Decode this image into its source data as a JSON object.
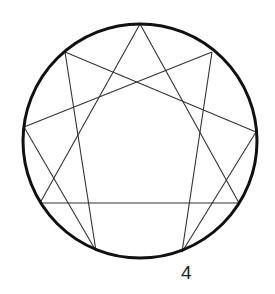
{
  "diagram": {
    "type": "enneagram",
    "circle": {
      "cx": 140,
      "cy": 141,
      "r": 117,
      "stroke": "#111111",
      "stroke_width": 3
    },
    "points": [
      {
        "x": 140,
        "y": 24
      },
      {
        "x": 212,
        "y": 52
      },
      {
        "x": 256,
        "y": 132
      },
      {
        "x": 239,
        "y": 203
      },
      {
        "x": 182,
        "y": 252
      },
      {
        "x": 96,
        "y": 251
      },
      {
        "x": 40,
        "y": 203
      },
      {
        "x": 24,
        "y": 127
      },
      {
        "x": 65,
        "y": 52
      }
    ],
    "line_color": "#333333",
    "labels": [
      {
        "text": "4",
        "x": 181,
        "y": 262
      }
    ]
  }
}
